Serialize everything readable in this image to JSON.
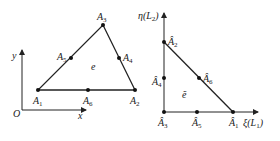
{
  "left_figure": {
    "origin_label": "O",
    "x_axis_label": "x",
    "y_axis_label": "y",
    "element_label": "e",
    "nodes": [
      {
        "name": "A",
        "sub": "1"
      },
      {
        "name": "A",
        "sub": "2"
      },
      {
        "name": "A",
        "sub": "3"
      },
      {
        "name": "A",
        "sub": "4"
      },
      {
        "name": "A",
        "sub": "5"
      },
      {
        "name": "A",
        "sub": "6"
      }
    ]
  },
  "right_figure": {
    "xi_axis_label": "ξ(L",
    "xi_axis_sub": "1",
    "xi_axis_close": ")",
    "eta_axis_label": "η(L",
    "eta_axis_sub": "2",
    "eta_axis_close": ")",
    "element_label": "ẽ",
    "nodes": [
      {
        "name": "Â",
        "sub": "1"
      },
      {
        "name": "Â",
        "sub": "2"
      },
      {
        "name": "Â",
        "sub": "3"
      },
      {
        "name": "Â",
        "sub": "4"
      },
      {
        "name": "Â",
        "sub": "5"
      },
      {
        "name": "Â",
        "sub": "6"
      }
    ]
  }
}
